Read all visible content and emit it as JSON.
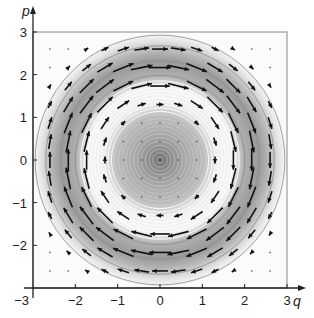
{
  "chart_data": {
    "type": "vector-field",
    "title": "",
    "xlabel": "q",
    "ylabel": "p",
    "xlim": [
      -3,
      3
    ],
    "ylim": [
      -3,
      3
    ],
    "xticks": [
      -3,
      -2,
      -1,
      0,
      1,
      2,
      3
    ],
    "yticks": [
      -3,
      -2,
      -1,
      0,
      1,
      2,
      3
    ],
    "xtick_labels": [
      "−3",
      "−2",
      "−1",
      "0",
      "1",
      "2",
      "3"
    ],
    "ytick_labels": [
      "−3",
      "−2",
      "−1",
      "0",
      "1",
      "2",
      "3"
    ],
    "grid": false,
    "field": {
      "description": "Circular (clockwise) rotational flow around origin; arrow direction (p, -q); magnitude largest near r≈2, vanishing at origin and beyond r≈3",
      "grid_min": -2.6,
      "grid_max": 2.6,
      "grid_count": 13,
      "direction": "clockwise"
    },
    "background": {
      "type": "radial contour shading",
      "bands": [
        {
          "r_from": 0.0,
          "r_to": 0.4,
          "shade": "dark gray"
        },
        {
          "r_from": 0.4,
          "r_to": 1.1,
          "shade": "medium gray with contour rings"
        },
        {
          "r_from": 1.1,
          "r_to": 1.9,
          "shade": "light / white rings"
        },
        {
          "r_from": 1.9,
          "r_to": 2.6,
          "shade": "medium gray band"
        },
        {
          "r_from": 2.6,
          "r_to": 3.0,
          "shade": "fading to white"
        }
      ]
    },
    "colors": {
      "arrow": "#111111",
      "axis": "#222222",
      "frame": "#888888"
    }
  }
}
